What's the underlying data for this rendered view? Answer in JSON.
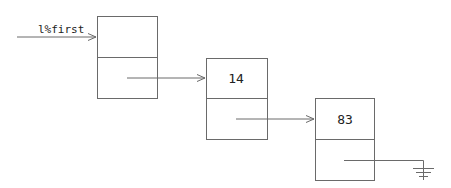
{
  "diagram": {
    "head_label": "l%first",
    "nodes": [
      {
        "value": "",
        "x": 97,
        "y": 16,
        "w": 60,
        "h": 82
      },
      {
        "value": "14",
        "x": 206,
        "y": 58,
        "w": 61,
        "h": 81
      },
      {
        "value": "83",
        "x": 315,
        "y": 98,
        "w": 59,
        "h": 82
      }
    ],
    "terminator": "null-ground"
  }
}
